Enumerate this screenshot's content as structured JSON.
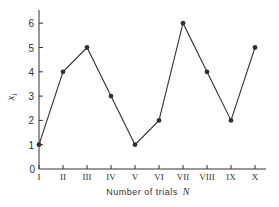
{
  "chart_data": {
    "type": "line",
    "title": "",
    "categories": [
      "I",
      "II",
      "III",
      "IV",
      "V",
      "VI",
      "VII",
      "VIII",
      "IX",
      "X"
    ],
    "series": [
      {
        "name": "x_i",
        "values": [
          1,
          4,
          5,
          3,
          1,
          2,
          6,
          4,
          2,
          5
        ],
        "marker": "filled-circle",
        "color": "#333333"
      }
    ],
    "xlabel": "Number of trials",
    "xlabel_var": "N",
    "ylabel": "x",
    "ylabel_sub": "i",
    "yticks": [
      "0",
      "1",
      "2",
      "3",
      "4",
      "5",
      "6"
    ],
    "ylim": [
      0,
      6.5
    ],
    "grid": false,
    "legend": null
  }
}
